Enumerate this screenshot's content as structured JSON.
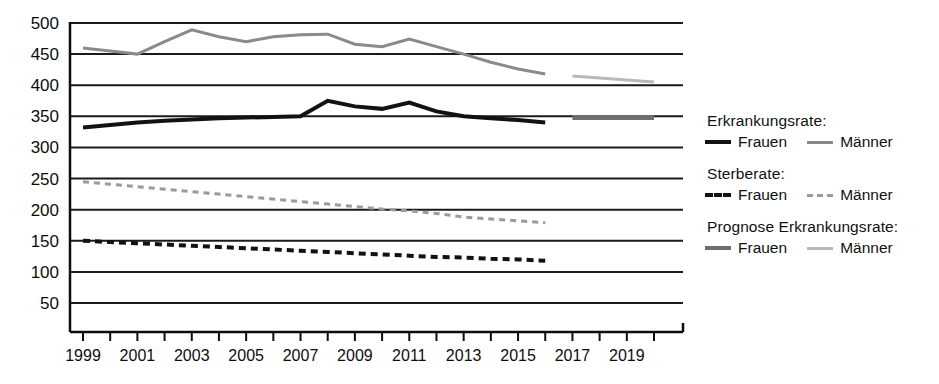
{
  "chart_data": {
    "type": "line",
    "title": "",
    "xlabel": "",
    "ylabel": "",
    "xlim": [
      1998.5,
      2020.5
    ],
    "ylim": [
      0,
      500
    ],
    "grid": true,
    "legend_position": "right",
    "y_ticks": [
      50,
      100,
      150,
      200,
      250,
      300,
      350,
      400,
      450,
      500
    ],
    "x_ticks": [
      1999,
      2000,
      2001,
      2002,
      2003,
      2004,
      2005,
      2006,
      2007,
      2008,
      2009,
      2010,
      2011,
      2012,
      2013,
      2014,
      2015,
      2016,
      2017,
      2018,
      2019,
      2020
    ],
    "x_tick_labels": [
      "1999",
      "",
      "2001",
      "",
      "2003",
      "",
      "2005",
      "",
      "2007",
      "",
      "2009",
      "",
      "2011",
      "",
      "2013",
      "",
      "2015",
      "",
      "2017",
      "",
      "2019",
      ""
    ],
    "series": [
      {
        "name": "Erkrankungsrate Frauen",
        "group": "Erkrankungsrate",
        "label": "Frauen",
        "style": "solid",
        "color": "#121212",
        "width": 4,
        "x": [
          1999,
          2000,
          2001,
          2002,
          2003,
          2004,
          2005,
          2006,
          2007,
          2008,
          2009,
          2010,
          2011,
          2012,
          2013,
          2014,
          2015,
          2016
        ],
        "values": [
          332,
          336,
          340,
          343,
          345,
          347,
          348,
          349,
          350,
          375,
          366,
          362,
          372,
          358,
          350,
          347,
          344,
          340
        ]
      },
      {
        "name": "Erkrankungsrate Maenner",
        "group": "Erkrankungsrate",
        "label": "Männer",
        "style": "solid",
        "color": "#8a8a8a",
        "width": 3,
        "x": [
          1999,
          2000,
          2001,
          2002,
          2003,
          2004,
          2005,
          2006,
          2007,
          2008,
          2009,
          2010,
          2011,
          2012,
          2013,
          2014,
          2015,
          2016
        ],
        "values": [
          460,
          455,
          450,
          470,
          489,
          478,
          470,
          478,
          481,
          482,
          466,
          462,
          474,
          462,
          450,
          437,
          426,
          418
        ]
      },
      {
        "name": "Sterberate Frauen",
        "group": "Sterberate",
        "label": "Frauen",
        "style": "dashed",
        "color": "#121212",
        "width": 4,
        "x": [
          1999,
          2000,
          2001,
          2002,
          2003,
          2004,
          2005,
          2006,
          2007,
          2008,
          2009,
          2010,
          2011,
          2012,
          2013,
          2014,
          2015,
          2016
        ],
        "values": [
          150,
          148,
          146,
          144,
          142,
          140,
          138,
          136,
          134,
          132,
          130,
          128,
          126,
          124,
          123,
          121,
          120,
          118
        ]
      },
      {
        "name": "Sterberate Maenner",
        "group": "Sterberate",
        "label": "Männer",
        "style": "dashed",
        "color": "#9a9a9a",
        "width": 3,
        "x": [
          1999,
          2000,
          2001,
          2002,
          2003,
          2004,
          2005,
          2006,
          2007,
          2008,
          2009,
          2010,
          2011,
          2012,
          2013,
          2014,
          2015,
          2016
        ],
        "values": [
          245,
          241,
          237,
          233,
          229,
          225,
          221,
          217,
          213,
          209,
          205,
          201,
          198,
          194,
          188,
          185,
          182,
          179
        ]
      },
      {
        "name": "Prognose Erkrankungsrate Frauen",
        "group": "Prognose Erkrankungsrate",
        "label": "Frauen",
        "style": "solid",
        "color": "#6e6e6e",
        "width": 5,
        "x": [
          2017,
          2020
        ],
        "values": [
          348,
          348
        ]
      },
      {
        "name": "Prognose Erkrankungsrate Maenner",
        "group": "Prognose Erkrankungsrate",
        "label": "Männer",
        "style": "solid",
        "color": "#b9b9b9",
        "width": 3,
        "x": [
          2017,
          2020
        ],
        "values": [
          415,
          405
        ]
      }
    ]
  },
  "legend": {
    "groups": [
      {
        "title": "Erkrankungsrate:",
        "entries": [
          {
            "label": "Frauen",
            "swatch": "solid-black"
          },
          {
            "label": "Männer",
            "swatch": "solid-gray"
          }
        ]
      },
      {
        "title": "Sterberate:",
        "entries": [
          {
            "label": "Frauen",
            "swatch": "dash-black"
          },
          {
            "label": "Männer",
            "swatch": "dash-gray"
          }
        ]
      },
      {
        "title": "Prognose Erkrankungsrate:",
        "entries": [
          {
            "label": "Frauen",
            "swatch": "solid-darkgray"
          },
          {
            "label": "Männer",
            "swatch": "solid-lightgray"
          }
        ]
      }
    ]
  },
  "colors": {
    "axis": "#0d0d0d",
    "grid": "#1a1a1a",
    "background": "#ffffff"
  }
}
